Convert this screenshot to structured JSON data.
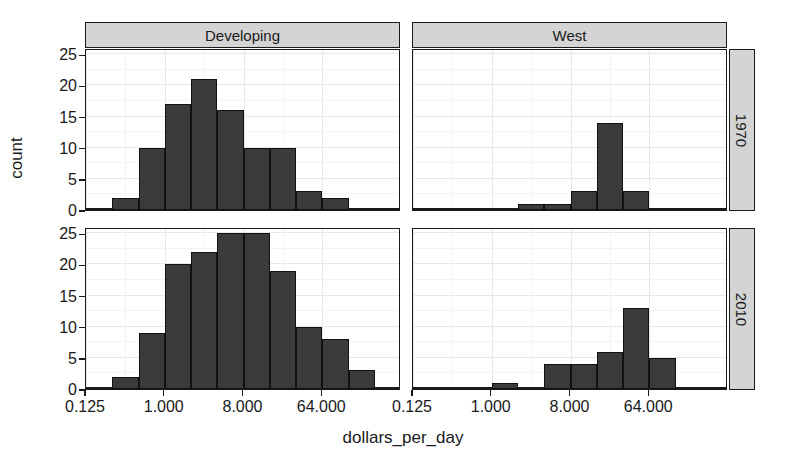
{
  "chart_data": {
    "type": "bar",
    "title": "",
    "xlabel": "dollars_per_day",
    "ylabel": "count",
    "grid": true,
    "legend": "none",
    "facet_layout": "2x2",
    "facet_columns": [
      "Developing",
      "West"
    ],
    "facet_rows": [
      "1970",
      "2010"
    ],
    "x_scale": "log2",
    "xlim": [
      0.125,
      512
    ],
    "xticks": [
      0.125,
      1,
      8,
      64
    ],
    "xtick_labels": [
      "0.125",
      "1.000",
      "8.000",
      "64.000"
    ],
    "ylim": [
      0,
      26
    ],
    "yticks": [
      0,
      5,
      10,
      15,
      20,
      25
    ],
    "ytick_labels": [
      "0",
      "5",
      "10",
      "15",
      "20",
      "25"
    ],
    "bin_edges_log2": [
      -3,
      -2,
      -1,
      0,
      1,
      2,
      3,
      4,
      5,
      6,
      7,
      8,
      9
    ],
    "panels": [
      {
        "facet_col": "Developing",
        "facet_row": "1970",
        "bin_starts_log2": [
          -3,
          -2,
          -1,
          0,
          1,
          2,
          3,
          4,
          5,
          6,
          7,
          8
        ],
        "values": [
          0,
          2,
          10,
          17,
          21,
          16,
          10,
          10,
          3,
          2,
          0,
          0
        ]
      },
      {
        "facet_col": "West",
        "facet_row": "1970",
        "bin_starts_log2": [
          -3,
          -2,
          -1,
          0,
          1,
          2,
          3,
          4,
          5,
          6,
          7,
          8
        ],
        "values": [
          0,
          0,
          0,
          0,
          1,
          1,
          3,
          14,
          3,
          0,
          0,
          0
        ]
      },
      {
        "facet_col": "Developing",
        "facet_row": "2010",
        "bin_starts_log2": [
          -3,
          -2,
          -1,
          0,
          1,
          2,
          3,
          4,
          5,
          6,
          7,
          8
        ],
        "values": [
          0,
          2,
          9,
          20,
          22,
          25,
          25,
          19,
          10,
          8,
          3,
          0
        ]
      },
      {
        "facet_col": "West",
        "facet_row": "2010",
        "bin_starts_log2": [
          -3,
          -2,
          -1,
          0,
          1,
          2,
          3,
          4,
          5,
          6,
          7,
          8
        ],
        "values": [
          0,
          0,
          0,
          1,
          0,
          4,
          4,
          6,
          13,
          5,
          0,
          0
        ]
      }
    ],
    "colors": {
      "bar_fill": "#3b3b3b",
      "bar_outline": "#111111",
      "panel_background": "#ffffff",
      "panel_border": "#1a1a1a",
      "grid": "#e8e8e8",
      "strip_background": "#d4d4d4",
      "text": "#1a1a1a"
    }
  },
  "axes": {
    "y_title": "count",
    "x_title": "dollars_per_day"
  },
  "strips": {
    "top": [
      {
        "label": "Developing"
      },
      {
        "label": "West"
      }
    ],
    "right": [
      {
        "label": "1970"
      },
      {
        "label": "2010"
      }
    ]
  }
}
